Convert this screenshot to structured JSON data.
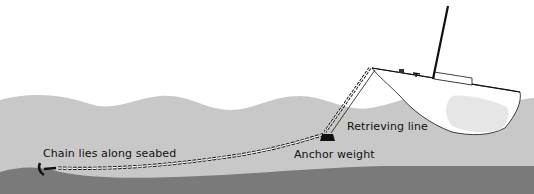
{
  "diagram": {
    "labels": {
      "chain": "Chain lies along seabed",
      "retrieving_line": "Retrieving line",
      "anchor_weight": "Anchor weight"
    },
    "colors": {
      "background": "#ffffff",
      "water": "#c8c8c8",
      "seabed": "#7a7a7a",
      "hull_shadow": "#e6e6e6",
      "line": "#111111"
    }
  }
}
